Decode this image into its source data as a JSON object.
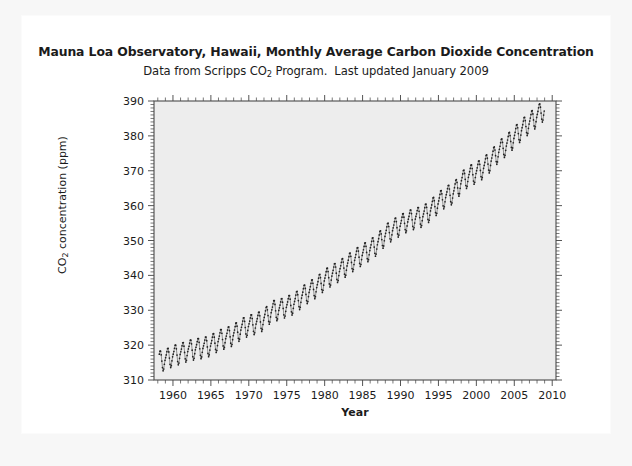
{
  "figure": {
    "title": "Mauna Loa Observatory, Hawaii, Monthly Average Carbon Dioxide Concentration",
    "title_parts": {
      "line1": "Mauna Loa Observatory, Hawaii, Monthly Average Carbon Dioxide Concentration"
    },
    "subtitle_part1": "Data from Scripps CO",
    "subtitle_sub": "2",
    "subtitle_part2": " Program.",
    "subtitle_part3": "Last updated January 2009",
    "background": "#ffffff",
    "plot_background": "#ededed"
  },
  "chart_data": {
    "type": "line",
    "title": "Mauna Loa Observatory, Hawaii, Monthly Average Carbon Dioxide Concentration",
    "subtitle": "Data from Scripps CO2 Program.   Last updated January 2009",
    "xlabel": "Year",
    "ylabel": "CO2 concentration (ppm)",
    "xlim": [
      1957.5,
      2010.5
    ],
    "ylim": [
      310,
      390
    ],
    "grid": false,
    "legend": null,
    "marker": "dot",
    "marker_color": "#222222",
    "x_major_ticks": [
      1960,
      1965,
      1970,
      1975,
      1980,
      1985,
      1990,
      1995,
      2000,
      2005,
      2010
    ],
    "x_major_tick_labels": [
      "1960",
      "1965",
      "1970",
      "1975",
      "1980",
      "1985",
      "1990",
      "1995",
      "2000",
      "2005",
      "2010"
    ],
    "x_minor_tick_step": 1,
    "y_major_ticks": [
      310,
      320,
      330,
      340,
      350,
      360,
      370,
      380,
      390
    ],
    "y_major_tick_labels": [
      "310",
      "320",
      "330",
      "340",
      "350",
      "360",
      "370",
      "380",
      "390"
    ],
    "y_minor_tick_step": 1,
    "series_name": "Monthly average CO2 concentration",
    "annual_mean": {
      "years": [
        1958,
        1959,
        1960,
        1961,
        1962,
        1963,
        1964,
        1965,
        1966,
        1967,
        1968,
        1969,
        1970,
        1971,
        1972,
        1973,
        1974,
        1975,
        1976,
        1977,
        1978,
        1979,
        1980,
        1981,
        1982,
        1983,
        1984,
        1985,
        1986,
        1987,
        1988,
        1989,
        1990,
        1991,
        1992,
        1993,
        1994,
        1995,
        1996,
        1997,
        1998,
        1999,
        2000,
        2001,
        2002,
        2003,
        2004,
        2005,
        2006,
        2007,
        2008,
        2009
      ],
      "values": [
        315.3,
        315.9,
        316.9,
        317.6,
        318.4,
        318.9,
        319.3,
        320.0,
        321.3,
        322.1,
        323.0,
        324.6,
        325.6,
        326.3,
        327.4,
        329.6,
        330.2,
        331.1,
        332.0,
        333.8,
        335.4,
        336.8,
        338.7,
        340.1,
        341.4,
        343.0,
        344.6,
        346.0,
        347.4,
        349.1,
        351.5,
        353.1,
        354.4,
        355.6,
        356.4,
        357.1,
        358.8,
        360.8,
        362.6,
        363.7,
        366.6,
        368.4,
        369.5,
        371.0,
        373.1,
        375.6,
        377.4,
        379.6,
        381.8,
        383.7,
        385.6,
        387.4
      ]
    },
    "seasonal_cycle": {
      "description": "Monthly departure from annual mean, peak in May, trough in late September",
      "month_offsets_ppm": [
        0.2,
        0.9,
        1.6,
        2.7,
        3.1,
        2.4,
        0.7,
        -1.4,
        -3.0,
        -3.1,
        -1.8,
        -0.5
      ],
      "amplitude_ppm": 6.2
    },
    "data_start_year": 1958.2,
    "data_end_year": 2009.0,
    "value_start_ppm": 315.3,
    "value_end_ppm": 387.4,
    "value_min_ppm": 313.0,
    "value_max_ppm": 388.5
  }
}
